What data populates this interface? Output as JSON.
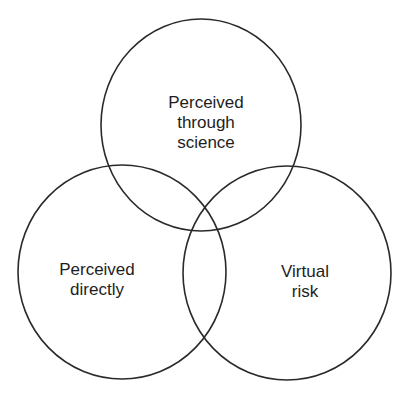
{
  "diagram": {
    "type": "venn",
    "sets": [
      {
        "id": "top",
        "lines": [
          "Perceived",
          "through",
          "science"
        ]
      },
      {
        "id": "left",
        "lines": [
          "Perceived",
          "directly"
        ]
      },
      {
        "id": "right",
        "lines": [
          "Virtual",
          "risk"
        ]
      }
    ],
    "colors": {
      "stroke": "#2a2a2a",
      "text": "#1e1e1e",
      "background": "#ffffff"
    }
  }
}
